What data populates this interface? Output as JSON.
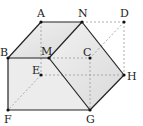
{
  "diagram": {
    "type": "cube-cross-section",
    "points": {
      "A": [
        41,
        22
      ],
      "N": [
        82,
        22
      ],
      "D": [
        124,
        22
      ],
      "B": [
        8,
        58
      ],
      "M": [
        49,
        58
      ],
      "C": [
        90,
        58
      ],
      "E": [
        41,
        75
      ],
      "H": [
        124,
        75
      ],
      "F": [
        8,
        110
      ],
      "G": [
        90,
        110
      ]
    },
    "labels": {
      "A": "A",
      "N": "N",
      "D": "D",
      "B": "B",
      "M": "M",
      "C": "C",
      "E": "E",
      "H": "H",
      "F": "F",
      "G": "G"
    },
    "colors": {
      "solid": "#222222",
      "dashed": "#888888",
      "fill": "#e6e6e6"
    }
  }
}
